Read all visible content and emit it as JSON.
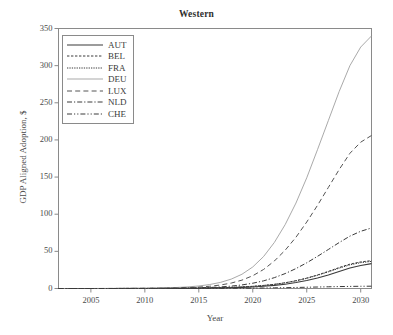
{
  "chart_data": {
    "type": "line",
    "title": "Western",
    "xlabel": "Year",
    "ylabel": "GDP Aligned Adoption, $",
    "xlim": [
      2002,
      2031
    ],
    "ylim": [
      0,
      350
    ],
    "xticks": [
      2005,
      2010,
      2015,
      2020,
      2025,
      2030
    ],
    "xtick_labels": [
      "2005",
      "2010",
      "2015",
      "2020",
      "2025",
      "2030"
    ],
    "yticks": [
      0,
      50,
      100,
      150,
      200,
      250,
      300,
      350
    ],
    "ytick_labels": [
      "0",
      "50",
      "100",
      "150",
      "200",
      "250",
      "300",
      "350"
    ],
    "grid": false,
    "legend_position": "upper left",
    "x": [
      2002,
      2003,
      2004,
      2005,
      2006,
      2007,
      2008,
      2009,
      2010,
      2011,
      2012,
      2013,
      2014,
      2015,
      2016,
      2017,
      2018,
      2019,
      2020,
      2021,
      2022,
      2023,
      2024,
      2025,
      2026,
      2027,
      2028,
      2029,
      2030,
      2031
    ],
    "series": [
      {
        "name": "AUT",
        "style": "solid",
        "color": "#3a3a3a",
        "values": [
          0,
          0,
          0,
          0,
          0,
          0,
          0,
          0.1,
          0.1,
          0.1,
          0.2,
          0.2,
          0.3,
          0.4,
          0.6,
          0.8,
          1.1,
          1.5,
          2.1,
          3.0,
          4.2,
          5.8,
          8.0,
          10.8,
          14.2,
          18.3,
          23.0,
          27.5,
          31.0,
          33.5
        ]
      },
      {
        "name": "BEL",
        "style": "dotted-fine",
        "color": "#3a3a3a",
        "values": [
          0,
          0,
          0,
          0,
          0,
          0,
          0.1,
          0.1,
          0.1,
          0.2,
          0.2,
          0.3,
          0.4,
          0.6,
          0.8,
          1.1,
          1.5,
          2.1,
          2.9,
          4.1,
          5.6,
          7.7,
          10.5,
          14.0,
          18.2,
          23.0,
          28.2,
          32.8,
          35.8,
          37.5
        ]
      },
      {
        "name": "FRA",
        "style": "dotted-dense",
        "color": "#3a3a3a",
        "values": [
          0,
          0,
          0,
          0,
          0,
          0,
          0.1,
          0.1,
          0.1,
          0.2,
          0.2,
          0.3,
          0.4,
          0.6,
          0.8,
          1.1,
          1.5,
          2.1,
          2.9,
          4.1,
          5.6,
          7.6,
          10.3,
          13.7,
          17.8,
          22.4,
          27.4,
          31.8,
          34.8,
          36.5
        ]
      },
      {
        "name": "DEU",
        "style": "solid-thin",
        "color": "#9a9a9a",
        "values": [
          0,
          0,
          0,
          0,
          0.1,
          0.1,
          0.2,
          0.3,
          0.4,
          0.6,
          0.9,
          1.4,
          2.2,
          3.4,
          5.3,
          8.2,
          12.6,
          19.2,
          29.0,
          43.0,
          62.0,
          86.0,
          115.0,
          149.0,
          187.0,
          226.0,
          265.0,
          300.0,
          325.0,
          340.0
        ]
      },
      {
        "name": "LUX",
        "style": "dashed",
        "color": "#555555",
        "values": [
          0,
          0,
          0,
          0,
          0,
          0.1,
          0.1,
          0.2,
          0.2,
          0.3,
          0.5,
          0.8,
          1.2,
          1.9,
          3.0,
          4.7,
          7.3,
          11.3,
          17.2,
          25.6,
          37.0,
          51.5,
          69.0,
          89.5,
          112.0,
          136.0,
          160.0,
          182.0,
          197.0,
          206.0
        ]
      },
      {
        "name": "NLD",
        "style": "dash-dot",
        "color": "#3a3a3a",
        "values": [
          0,
          0,
          0,
          0,
          0,
          0,
          0.1,
          0.1,
          0.1,
          0.2,
          0.3,
          0.4,
          0.6,
          0.9,
          1.4,
          2.1,
          3.2,
          4.8,
          7.1,
          10.3,
          14.6,
          20.1,
          26.8,
          34.6,
          43.3,
          52.5,
          61.8,
          70.5,
          77.0,
          81.5
        ]
      },
      {
        "name": "CHE",
        "style": "dash-dot-dot",
        "color": "#3a3a3a",
        "values": [
          0,
          0,
          0,
          0,
          0,
          0,
          0,
          0,
          0,
          0,
          0,
          0.1,
          0.1,
          0.1,
          0.2,
          0.2,
          0.3,
          0.4,
          0.5,
          0.7,
          0.9,
          1.1,
          1.4,
          1.7,
          2.0,
          2.3,
          2.6,
          2.8,
          3.0,
          3.1
        ]
      }
    ]
  },
  "legend": {
    "items": [
      {
        "label": "AUT"
      },
      {
        "label": "BEL"
      },
      {
        "label": "FRA"
      },
      {
        "label": "DEU"
      },
      {
        "label": "LUX"
      },
      {
        "label": "NLD"
      },
      {
        "label": "CHE"
      }
    ]
  }
}
